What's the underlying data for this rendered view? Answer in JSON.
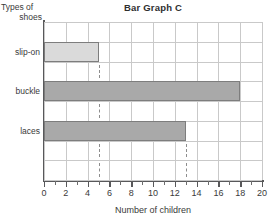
{
  "chart_data": {
    "type": "bar",
    "orientation": "horizontal",
    "title": "Bar Graph C",
    "xlabel": "Number of children",
    "ylabel": "Types of shoes",
    "ylabel_lines": [
      "Types of",
      "shoes"
    ],
    "categories": [
      "slip-on",
      "buckle",
      "laces"
    ],
    "values": [
      5,
      18,
      13
    ],
    "xlim": [
      0,
      20
    ],
    "xticks": [
      0,
      2,
      4,
      6,
      8,
      10,
      12,
      14,
      16,
      18,
      20
    ],
    "xtick_labels": [
      "0",
      "2",
      "4",
      "6",
      "8",
      "10",
      "12",
      "14",
      "16",
      "18",
      "20"
    ],
    "minor_xticks": [
      1,
      3,
      5,
      7,
      9,
      11,
      13,
      15,
      17,
      19
    ],
    "grid": true,
    "legend": null,
    "bar_colors": [
      "#dadada",
      "#a9a9a9",
      "#a9a9a9"
    ],
    "bar_border_color": "#7d7d7d",
    "grid_color": "#c9c9c9",
    "axis_color": "#58585a",
    "annotations": [
      {
        "name": "dashed-marker-5",
        "x": 5,
        "style": "dashed-vertical"
      },
      {
        "name": "dashed-marker-13",
        "x": 13,
        "style": "dashed-vertical"
      }
    ]
  }
}
